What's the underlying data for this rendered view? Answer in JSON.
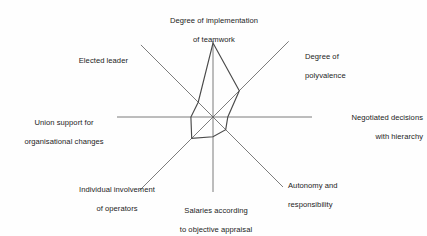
{
  "chart_data": {
    "type": "radar",
    "title": "",
    "subtitle": "",
    "xlabel": "",
    "ylabel": "",
    "grid": false,
    "legend_position": "none",
    "axis_count": 8,
    "value_range": [
      0,
      100
    ],
    "categories": [
      "Degree of implementation of teamwork",
      "Degree of polyvalence",
      "Negotiated decisions with hierarchy",
      "Autonomy and responsibility",
      "Salaries according to objective appraisal",
      "Individual involvement of operators",
      "Union support for organisational changes",
      "Elected leader"
    ],
    "series": [
      {
        "name": "",
        "values": [
          100,
          62,
          45,
          30,
          52,
          58,
          48,
          38
        ]
      }
    ],
    "axes": [
      {
        "id": "axis-teamwork",
        "label_line1": "Degree of implementation",
        "label_line2": "of teamwork",
        "label_full": "Degree of implementation of teamwork",
        "angle_deg": 90,
        "value": 100
      },
      {
        "id": "axis-polyvalence",
        "label_line1": "Degree of",
        "label_line2": "polyvalence",
        "label_full": "Degree of polyvalence",
        "angle_deg": 45,
        "value": 62
      },
      {
        "id": "axis-negotiated-decisions",
        "label_line1": "Negotiated decisions",
        "label_line2": "with hierarchy",
        "label_full": "Negotiated decisions with hierarchy",
        "angle_deg": 0,
        "value": 45
      },
      {
        "id": "axis-autonomy",
        "label_line1": "Autonomy and",
        "label_line2": "responsibility",
        "label_full": "Autonomy and responsibility",
        "angle_deg": -45,
        "value": 30
      },
      {
        "id": "axis-salaries",
        "label_line1": "Salaries according",
        "label_line2": "to objective appraisal",
        "label_full": "Salaries according to objective appraisal",
        "angle_deg": -90,
        "value": 52
      },
      {
        "id": "axis-individual-involvement",
        "label_line1": "Individual involvement",
        "label_line2": "of operators",
        "label_full": "Individual involvement of operators",
        "angle_deg": -135,
        "value": 58
      },
      {
        "id": "axis-union-support",
        "label_line1": "Union support for",
        "label_line2": "organisational changes",
        "label_full": "Union support for organisational changes",
        "angle_deg": 180,
        "value": 48
      },
      {
        "id": "axis-elected-leader",
        "label_line1": "Elected leader",
        "label_line2": "",
        "label_full": "Elected leader",
        "angle_deg": 135,
        "value": 38
      }
    ],
    "colors": {
      "axis_line": "#5c5c5c",
      "data_line": "#4a4a4a",
      "background": "#fefefe",
      "text": "#1c1c1c"
    }
  }
}
